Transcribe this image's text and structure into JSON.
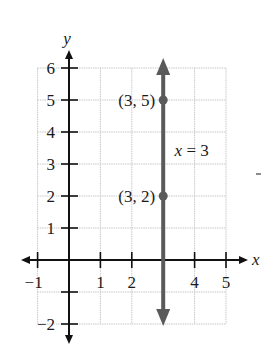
{
  "chart_data": {
    "type": "line",
    "title": "",
    "xlabel": "x",
    "ylabel": "y",
    "xlim": [
      -1,
      5
    ],
    "ylim": [
      -2,
      6
    ],
    "grid": true,
    "x_ticks": [
      -1,
      1,
      2,
      4,
      5
    ],
    "x_tick_labels": [
      "−1",
      "1",
      "2",
      "4",
      "5"
    ],
    "y_ticks": [
      -2,
      -1,
      1,
      2,
      3,
      4,
      5,
      6
    ],
    "y_tick_labels": [
      "−2",
      "",
      "1",
      "2",
      "3",
      "4",
      "5",
      "6"
    ],
    "series": [
      {
        "name": "x = 3",
        "kind": "vertical-line",
        "x": 3,
        "color": "#5a5a5a",
        "arrows": "both"
      }
    ],
    "points": [
      {
        "x": 3,
        "y": 5,
        "label": "(3, 5)"
      },
      {
        "x": 3,
        "y": 2,
        "label": "(3, 2)"
      }
    ],
    "annotations": [
      {
        "text": "x = 3",
        "x": 3.3,
        "y": 3.45
      }
    ]
  },
  "colors": {
    "axis": "#111111",
    "grid": "#c8c8c8",
    "line": "#5a5a5a"
  }
}
